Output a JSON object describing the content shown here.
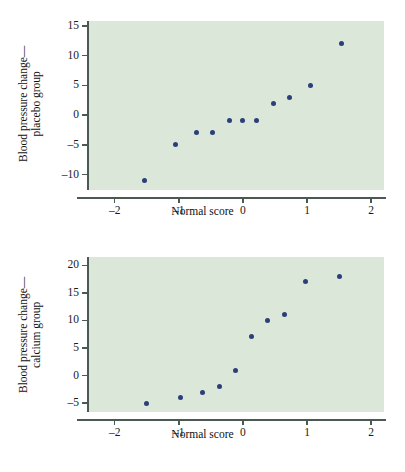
{
  "figure": {
    "background_color": "#ffffff",
    "plot_background_color": "#dbe7d8",
    "point_color": "#2b3f7a",
    "axis_color": "#4a5a52"
  },
  "chart_data": [
    {
      "type": "scatter",
      "id": "placebo",
      "title": "",
      "xlabel": "Normal score",
      "ylabel": "Blood pressure change—\nplacebo group",
      "ylabel_line1": "Blood pressure change—",
      "ylabel_line2": "placebo group",
      "xlim": [
        -2.4,
        2.2
      ],
      "ylim": [
        -12.6,
        15.8
      ],
      "xticks": [
        -2,
        -1,
        0,
        1,
        2
      ],
      "xticklabels": [
        "–2",
        "–1",
        "0",
        "1",
        "2"
      ],
      "yticks": [
        15,
        10,
        5,
        0,
        -5,
        -10
      ],
      "yticklabels": [
        "15",
        "10",
        "5",
        "0",
        "–5",
        "–10"
      ],
      "grid": false,
      "legend": "none",
      "x": [
        -1.54,
        -1.05,
        -0.72,
        -0.47,
        -0.21,
        0.0,
        0.21,
        0.47,
        0.72,
        1.05,
        1.54
      ],
      "y": [
        -11,
        -5,
        -3,
        -3,
        -1,
        -1,
        -1,
        2,
        3,
        5,
        12
      ]
    },
    {
      "type": "scatter",
      "id": "calcium",
      "title": "",
      "xlabel": "Normal score",
      "ylabel": "Blood pressure change—\ncalcium group",
      "ylabel_line1": "Blood pressure change—",
      "ylabel_line2": "calcium group",
      "xlim": [
        -2.4,
        2.2
      ],
      "ylim": [
        -6.6,
        21.5
      ],
      "xticks": [
        -2,
        -1,
        0,
        1,
        2
      ],
      "xticklabels": [
        "–2",
        "–1",
        "0",
        "1",
        "2"
      ],
      "yticks": [
        20,
        15,
        10,
        5,
        0,
        -5
      ],
      "yticklabels": [
        "20",
        "15",
        "10",
        "5",
        "0",
        "–5"
      ],
      "grid": false,
      "legend": "none",
      "x": [
        -1.5,
        -0.97,
        -0.63,
        -0.36,
        -0.12,
        0.13,
        0.39,
        0.65,
        0.98,
        1.51
      ],
      "y": [
        -5,
        -4,
        -3,
        -2,
        1,
        7,
        10,
        11,
        17,
        18
      ]
    }
  ]
}
